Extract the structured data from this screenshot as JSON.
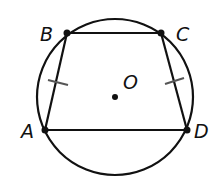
{
  "diagram": {
    "type": "inscribed-trapezoid-in-circle",
    "colors": {
      "stroke": "#111111",
      "tick": "#555555",
      "background": "#ffffff"
    },
    "circle": {
      "center_label": "O",
      "cx": 115,
      "cy": 97,
      "r": 78
    },
    "points": [
      {
        "label": "A",
        "x": 45,
        "y": 130
      },
      {
        "label": "B",
        "x": 67,
        "y": 33
      },
      {
        "label": "C",
        "x": 161,
        "y": 33
      },
      {
        "label": "D",
        "x": 187,
        "y": 130
      }
    ],
    "segments": [
      "AB",
      "BC",
      "CD",
      "DA"
    ],
    "congruence_marks": [
      "AB",
      "CD"
    ],
    "labels": {
      "A": "A",
      "B": "B",
      "C": "C",
      "D": "D",
      "O": "O"
    }
  }
}
